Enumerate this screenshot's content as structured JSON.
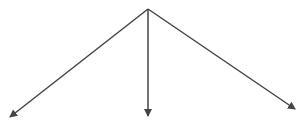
{
  "diagram": {
    "type": "branching-arrows",
    "background": "#ffffff",
    "stroke_color": "#444444",
    "stroke_width": 1.5,
    "origin": {
      "x": 148,
      "y": 9
    },
    "arrows": [
      {
        "name": "left",
        "to": {
          "x": 10,
          "y": 117
        }
      },
      {
        "name": "center",
        "to": {
          "x": 148,
          "y": 116
        }
      },
      {
        "name": "right",
        "to": {
          "x": 295,
          "y": 109
        }
      }
    ]
  }
}
